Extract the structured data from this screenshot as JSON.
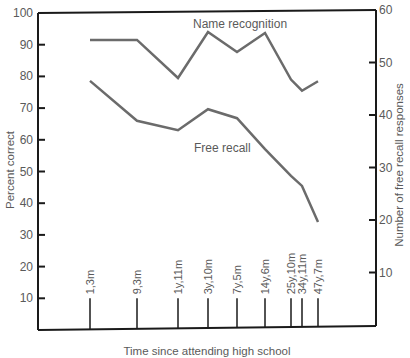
{
  "chart_data": {
    "type": "line",
    "title": "",
    "xlabel": "Time since attending high school",
    "ylabel_left": "Percent correct",
    "ylabel_right": "Number of free recall responses",
    "categories": [
      "1,3m",
      "9,3m",
      "1y,11m",
      "3y,10m",
      "7y,5m",
      "14y,6m",
      "25y,10m",
      "34y,11m",
      "47y,7m"
    ],
    "category_x_px": [
      90,
      137,
      178,
      208,
      237,
      265,
      291,
      302,
      318
    ],
    "ylim_left": [
      0,
      100
    ],
    "yticks_left": [
      10,
      20,
      30,
      40,
      50,
      60,
      70,
      80,
      90,
      100
    ],
    "ylim_right": [
      0,
      60
    ],
    "yticks_right": [
      10,
      20,
      30,
      40,
      50,
      60
    ],
    "grid": false,
    "legend": "inline labels",
    "series": [
      {
        "name": "Name recognition",
        "axis": "left",
        "values": [
          91.5,
          91.5,
          79.5,
          94,
          87.7,
          93.7,
          79,
          75.5,
          78.5
        ]
      },
      {
        "name": "Free recall",
        "axis": "right",
        "values": [
          46.5,
          38.9,
          37.1,
          41.1,
          39.4,
          33.5,
          28.4,
          26.5,
          19.6
        ]
      }
    ]
  },
  "labels": {
    "series_name_recognition": "Name recognition",
    "series_free_recall": "Free recall",
    "xlabel": "Time since attending high school",
    "ylabel_left": "Percent correct",
    "ylabel_right": "Number of free recall responses"
  },
  "colors": {
    "axis": "#1a1a1a",
    "series_line": "#6b6b6b",
    "text": "#5a5a5a"
  }
}
